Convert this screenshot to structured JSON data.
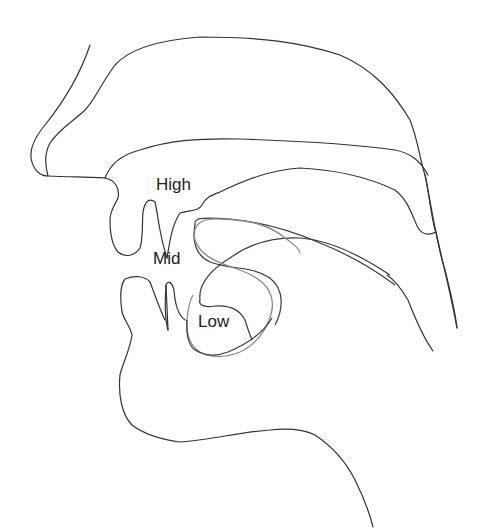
{
  "diagram": {
    "labels": {
      "high": "High",
      "mid": "Mid",
      "low": "Low"
    },
    "colors": {
      "background": "#ffffff",
      "outline": "#333333",
      "tongue_high_mid": "#3a3a3a",
      "tongue_low": "#8a8a8a",
      "text": "#222222"
    }
  }
}
